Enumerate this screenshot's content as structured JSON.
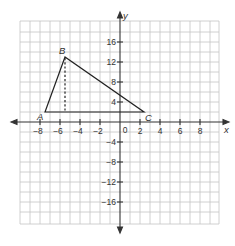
{
  "diagram": {
    "type": "coordinate-plane",
    "x_axis": {
      "label": "x",
      "min": -10,
      "max": 10,
      "grid_step": 1,
      "tick_labels": [
        "-8",
        "-6",
        "-4",
        "-2",
        "0",
        "2",
        "4",
        "6",
        "8"
      ]
    },
    "y_axis": {
      "label": "y",
      "min": -20,
      "max": 20,
      "grid_step": 2,
      "tick_labels": [
        "16",
        "12",
        "8",
        "4",
        "-4",
        "-8",
        "-12",
        "-16"
      ]
    },
    "triangle": {
      "vertices": [
        {
          "name": "A",
          "x": -8,
          "y": 2
        },
        {
          "name": "B",
          "x": -6,
          "y": 13
        },
        {
          "name": "C",
          "x": 3,
          "y": 2
        }
      ],
      "altitude": {
        "from": "B",
        "to_point": {
          "x": -6,
          "y": 2
        },
        "style": "dashed"
      }
    },
    "colors": {
      "grid": "#bdbdbd",
      "axis": "#333333",
      "triangle": "#222222"
    }
  },
  "labels": {
    "x_axis": "x",
    "y_axis": "y",
    "A": "A",
    "B": "B",
    "C": "C",
    "xt": [
      "−8",
      "−6",
      "−4",
      "−2",
      "0",
      "2",
      "4",
      "6",
      "8"
    ],
    "yt": [
      "16",
      "12",
      "8",
      "4",
      "−4",
      "−8",
      "−12",
      "−16"
    ]
  }
}
